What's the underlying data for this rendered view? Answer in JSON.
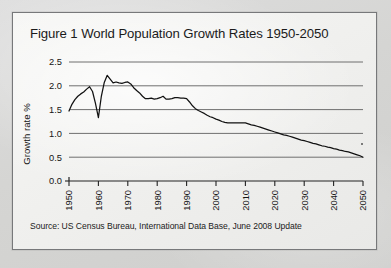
{
  "figure": {
    "title": "Figure 1 World Population Growth Rates 1950-2050",
    "source": "Source: US Census Bureau, International Data Base, June 2008 Update"
  },
  "colors": {
    "page_background": "#d8d8d6",
    "figure_background": "#f2f2f0",
    "frame_border": "#77787a",
    "gridline": "#6f6f6f",
    "axis": "#222222",
    "line": "#111111",
    "text": "#1b1b1b"
  },
  "chart_data": {
    "type": "line",
    "title": "Figure 1 World Population Growth Rates 1950-2050",
    "xlabel": "",
    "ylabel": "Growth rate %",
    "xlim": [
      1950,
      2050
    ],
    "ylim": [
      0.0,
      2.5
    ],
    "grid": true,
    "legend": "none",
    "yticks": [
      "0.0",
      "0.5",
      "1.0",
      "1.5",
      "2.0",
      "2.5"
    ],
    "ytick_values": [
      0.0,
      0.5,
      1.0,
      1.5,
      2.0,
      2.5
    ],
    "xticks": [
      "1950",
      "1960",
      "1970",
      "1980",
      "1990",
      "2000",
      "2010",
      "2020",
      "2030",
      "2040",
      "2050"
    ],
    "xtick_values": [
      1950,
      1960,
      1970,
      1980,
      1990,
      2000,
      2010,
      2020,
      2030,
      2040,
      2050
    ],
    "xtick_rotation": 90,
    "series": [
      {
        "name": "World population growth rate",
        "x": [
          1950,
          1951,
          1952,
          1953,
          1954,
          1955,
          1956,
          1957,
          1958,
          1959,
          1960,
          1961,
          1962,
          1963,
          1964,
          1965,
          1966,
          1967,
          1968,
          1969,
          1970,
          1971,
          1972,
          1973,
          1974,
          1975,
          1976,
          1977,
          1978,
          1979,
          1980,
          1981,
          1982,
          1983,
          1984,
          1985,
          1986,
          1987,
          1988,
          1989,
          1990,
          1991,
          1992,
          1993,
          1994,
          1995,
          1996,
          1997,
          1998,
          1999,
          2000,
          2001,
          2002,
          2003,
          2004,
          2005,
          2006,
          2007,
          2008,
          2009,
          2010,
          2011,
          2012,
          2013,
          2014,
          2015,
          2016,
          2017,
          2018,
          2019,
          2020,
          2021,
          2022,
          2023,
          2024,
          2025,
          2026,
          2027,
          2028,
          2029,
          2030,
          2031,
          2032,
          2033,
          2034,
          2035,
          2036,
          2037,
          2038,
          2039,
          2040,
          2041,
          2042,
          2043,
          2044,
          2045,
          2046,
          2047,
          2048,
          2049,
          2050
        ],
        "y": [
          1.47,
          1.61,
          1.71,
          1.78,
          1.83,
          1.87,
          1.93,
          1.98,
          1.88,
          1.63,
          1.33,
          1.78,
          2.07,
          2.22,
          2.14,
          2.06,
          2.08,
          2.06,
          2.05,
          2.07,
          2.08,
          2.04,
          1.96,
          1.9,
          1.85,
          1.78,
          1.73,
          1.73,
          1.74,
          1.72,
          1.73,
          1.75,
          1.78,
          1.72,
          1.72,
          1.73,
          1.75,
          1.75,
          1.74,
          1.74,
          1.73,
          1.66,
          1.58,
          1.52,
          1.48,
          1.45,
          1.42,
          1.38,
          1.35,
          1.33,
          1.3,
          1.28,
          1.25,
          1.23,
          1.22,
          1.22,
          1.22,
          1.22,
          1.22,
          1.22,
          1.22,
          1.2,
          1.18,
          1.17,
          1.15,
          1.13,
          1.11,
          1.09,
          1.07,
          1.05,
          1.03,
          1.01,
          0.99,
          0.97,
          0.96,
          0.94,
          0.92,
          0.9,
          0.88,
          0.86,
          0.85,
          0.83,
          0.81,
          0.79,
          0.78,
          0.76,
          0.74,
          0.73,
          0.71,
          0.7,
          0.68,
          0.67,
          0.65,
          0.64,
          0.62,
          0.61,
          0.59,
          0.57,
          0.55,
          0.53,
          0.5
        ]
      }
    ],
    "annotations": [
      {
        "label": "peak",
        "x": 1963,
        "y": 2.22
      },
      {
        "label": "famine-trough",
        "x": 1960,
        "y": 1.33
      },
      {
        "label": "endpoint",
        "x": 2050,
        "y": 0.5
      }
    ]
  }
}
